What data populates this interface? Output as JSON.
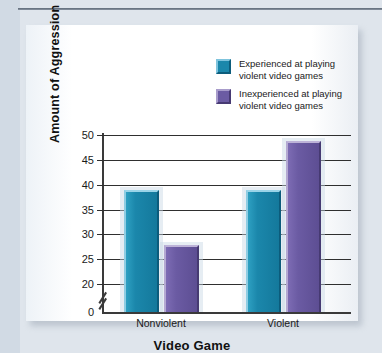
{
  "page": {
    "caption_fragment": "",
    "background_color": "#dfe5ec",
    "panel_color": "#ffffff"
  },
  "chart_data": {
    "type": "bar",
    "title": "",
    "xlabel": "Video Game",
    "ylabel": "Amount of Aggression",
    "categories": [
      "Nonviolent",
      "Violent"
    ],
    "series": [
      {
        "name": "Experienced at playing\nviolent video games",
        "color": "#1b87ab",
        "values": [
          39,
          39
        ]
      },
      {
        "name": "Inexperienced at playing\nviolent video games",
        "color": "#6b5ba3",
        "values": [
          27.8,
          48.7
        ]
      }
    ],
    "ylim": [
      20,
      50
    ],
    "yticks": [
      20,
      25,
      30,
      35,
      40,
      45,
      50
    ],
    "ytick_labels": [
      "20",
      "25",
      "30",
      "35",
      "40",
      "45",
      "50"
    ],
    "zero_tick_label": "0",
    "axis_break": true,
    "grid": true,
    "legend_position": "top-right"
  }
}
